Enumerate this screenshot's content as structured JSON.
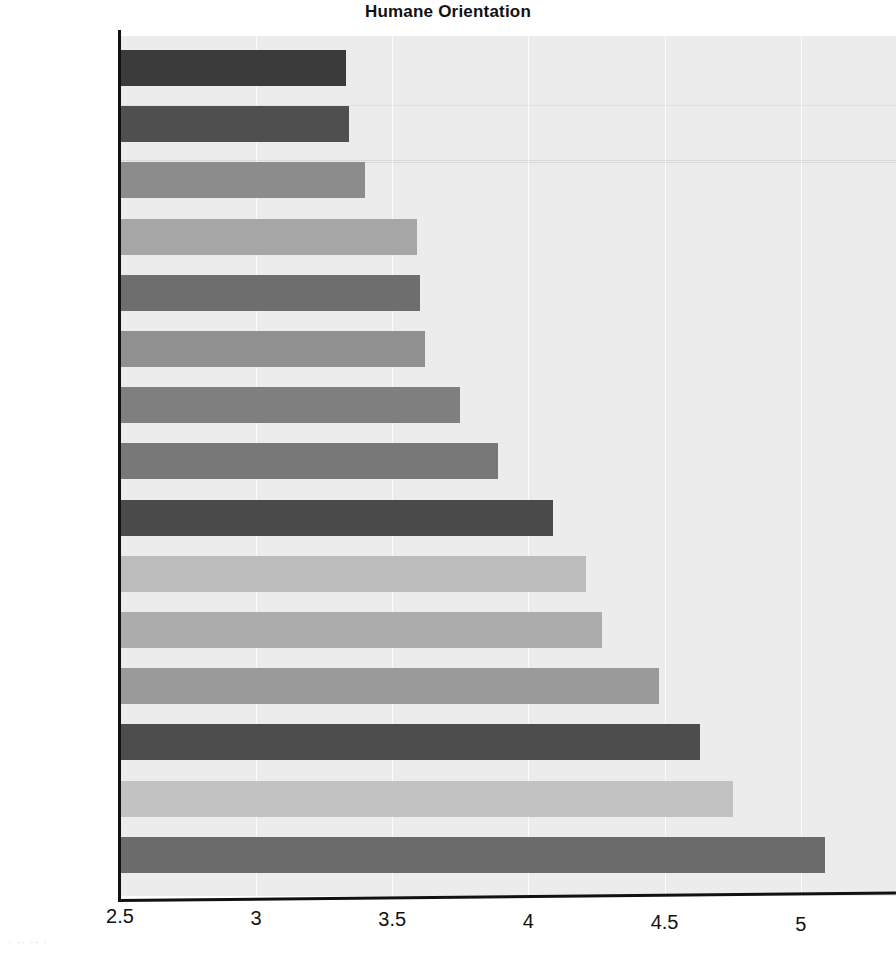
{
  "chart_data": {
    "type": "bar",
    "orientation": "horizontal",
    "title": "Humane Orientation",
    "xlabel": "",
    "ylabel": "",
    "xlim": [
      2.5,
      5.35
    ],
    "grid": true,
    "legend": "none",
    "xticks": [
      "2.5",
      "3",
      "3.5",
      "4",
      "4.5",
      "5"
    ],
    "xtick_values": [
      2.5,
      3,
      3.5,
      4,
      4.5,
      5
    ],
    "categories": [
      "Spain",
      "Greece",
      "Germany",
      "Poland",
      "Italy",
      "Brazil",
      "Slovenia",
      "Turkey",
      "USA",
      "Japan",
      "China",
      "India",
      "Egypt",
      "Malaysia",
      "Zambia"
    ],
    "values": [
      3.33,
      3.34,
      3.4,
      3.59,
      3.6,
      3.62,
      3.75,
      3.89,
      4.09,
      4.21,
      4.27,
      4.48,
      4.63,
      4.75,
      5.09
    ],
    "bar_colors": [
      "#3b3b3b",
      "#4f4f4f",
      "#8c8c8c",
      "#a6a6a6",
      "#6e6e6e",
      "#909090",
      "#7f7f7f",
      "#787878",
      "#4a4a4a",
      "#bcbcbc",
      "#acacac",
      "#9a9a9a",
      "#4d4d4d",
      "#c2c2c2",
      "#6b6b6b"
    ],
    "plot_background": "#ececec",
    "axis_color": "#111111",
    "gridline_color": "#ffffff"
  },
  "caption": {
    "smudge_text": "· ·· ·· ·"
  }
}
